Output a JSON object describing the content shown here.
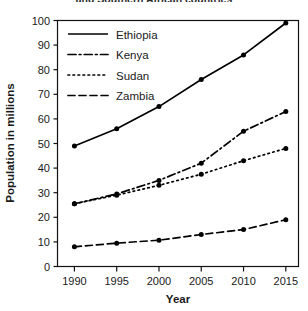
{
  "chart_data": {
    "type": "line",
    "title": "and Southern African countries",
    "xlabel": "Year",
    "ylabel": "Population in millions",
    "x": [
      1990,
      1995,
      2000,
      2005,
      2010,
      2015
    ],
    "xtick_labels": [
      "1990",
      "1995",
      "2000",
      "2005",
      "2010",
      "2015"
    ],
    "ytick_labels": [
      "0",
      "10",
      "20",
      "30",
      "40",
      "50",
      "60",
      "70",
      "80",
      "90",
      "100"
    ],
    "xlim": [
      1988,
      2016.5
    ],
    "ylim": [
      0,
      100
    ],
    "grid": false,
    "legend_position": "top-left-inside",
    "marker": "filled-circle",
    "series": [
      {
        "name": "Ethiopia",
        "style": "solid",
        "color": "#000000",
        "values": [
          49,
          56,
          65,
          76,
          86,
          99
        ]
      },
      {
        "name": "Kenya",
        "style": "dash-dot",
        "color": "#000000",
        "values": [
          25.5,
          29.5,
          35,
          42,
          55,
          63
        ]
      },
      {
        "name": "Sudan",
        "style": "dotted",
        "color": "#000000",
        "values": [
          25.5,
          29,
          33,
          37.5,
          43,
          48
        ]
      },
      {
        "name": "Zambia",
        "style": "dashed",
        "color": "#000000",
        "values": [
          8,
          9.5,
          10.7,
          13,
          15,
          19
        ]
      }
    ]
  },
  "axes": {
    "y_title": "Population in millions",
    "x_title": "Year"
  },
  "legend": {
    "entries": [
      {
        "label": "Ethiopia"
      },
      {
        "label": "Kenya"
      },
      {
        "label": "Sudan"
      },
      {
        "label": "Zambia"
      }
    ]
  },
  "title_fragment": "and Southern African countries"
}
